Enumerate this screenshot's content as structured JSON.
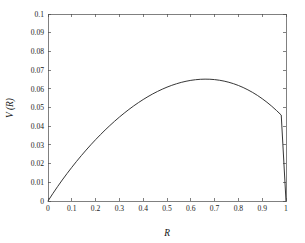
{
  "chart_data": {
    "type": "line",
    "title": "",
    "subtitle": "",
    "xlabel": "R",
    "ylabel": "V (R)",
    "xlim": [
      0,
      1
    ],
    "ylim": [
      0,
      0.1
    ],
    "grid": false,
    "legend": null,
    "legend_position": "none",
    "box": true,
    "tick_direction": "in",
    "xticks": [
      0,
      0.1,
      0.2,
      0.3,
      0.4,
      0.5,
      0.6,
      0.7,
      0.8,
      0.9,
      1
    ],
    "xticklabels": [
      "0",
      "0.1",
      "0.2",
      "0.3",
      "0.4",
      "0.5",
      "0.6",
      "0.7",
      "0.8",
      "0.9",
      "1"
    ],
    "yticks": [
      0,
      0.01,
      0.02,
      0.03,
      0.04,
      0.05,
      0.06,
      0.07,
      0.08,
      0.09,
      0.1
    ],
    "yticklabels": [
      "0",
      "0.01",
      "0.02",
      "0.03",
      "0.04",
      "0.05",
      "0.06",
      "0.07",
      "0.08",
      "0.09",
      "0.1"
    ],
    "series": [
      {
        "name": "V(R)",
        "color": "#2b2b2b",
        "peak_x": 0.58,
        "peak_y": 0.0765,
        "x": [
          0,
          0.02,
          0.04,
          0.06,
          0.08,
          0.1,
          0.12,
          0.14,
          0.16,
          0.18,
          0.2,
          0.22,
          0.24,
          0.26,
          0.28,
          0.3,
          0.32,
          0.34,
          0.36,
          0.38,
          0.4,
          0.42,
          0.44,
          0.46,
          0.48,
          0.5,
          0.52,
          0.54,
          0.56,
          0.58,
          0.6,
          0.62,
          0.64,
          0.66,
          0.68,
          0.7,
          0.72,
          0.74,
          0.76,
          0.78,
          0.8,
          0.82,
          0.84,
          0.86,
          0.88,
          0.9,
          0.92,
          0.94,
          0.96,
          0.98,
          1
        ],
        "y": [
          0,
          0.00391,
          0.00765,
          0.01124,
          0.01468,
          0.018,
          0.02119,
          0.02426,
          0.02722,
          0.03007,
          0.0328,
          0.03543,
          0.03795,
          0.04036,
          0.04267,
          0.04488,
          0.04697,
          0.04896,
          0.05084,
          0.05261,
          0.05427,
          0.05582,
          0.05726,
          0.05858,
          0.05979,
          0.06088,
          0.06185,
          0.0627,
          0.06343,
          0.06403,
          0.06451,
          0.06486,
          0.06508,
          0.06516,
          0.06511,
          0.06492,
          0.06459,
          0.06411,
          0.06348,
          0.06271,
          0.06178,
          0.06069,
          0.05944,
          0.05803,
          0.05646,
          0.05471,
          0.05279,
          0.05069,
          0.04841,
          0.04595,
          0
        ]
      }
    ]
  },
  "axes": {
    "x_title": "R",
    "y_title": "V (R)"
  }
}
